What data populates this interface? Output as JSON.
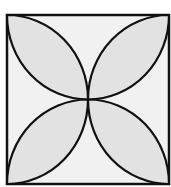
{
  "diagram": {
    "colors": {
      "background": "#ffffff",
      "square_fill": "#f1f1f1",
      "petal_fill": "#e2e2e2",
      "stroke": "#111111"
    },
    "square": {
      "x": 7,
      "y": 15,
      "size": 162
    },
    "petals": [
      "top-left",
      "top-right",
      "bottom-left",
      "bottom-right"
    ]
  }
}
